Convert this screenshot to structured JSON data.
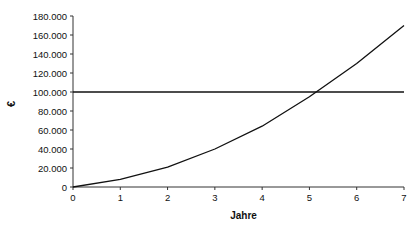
{
  "chart_data": {
    "type": "line",
    "title": "",
    "xlabel": "Jahre",
    "ylabel": "€",
    "x": [
      0,
      1,
      2,
      3,
      4,
      5,
      6,
      7
    ],
    "x_ticks": [
      "0",
      "1",
      "2",
      "3",
      "4",
      "5",
      "6",
      "7"
    ],
    "y_ticks": [
      "0",
      "20.000",
      "40.000",
      "60.000",
      "80.000",
      "100.000",
      "120.000",
      "140.000",
      "160.000",
      "180.000"
    ],
    "xlim": [
      0,
      7
    ],
    "ylim": [
      0,
      180000
    ],
    "grid": false,
    "legend": null,
    "series": [
      {
        "name": "Kurve",
        "values": [
          0,
          8000,
          21000,
          40000,
          64000,
          95000,
          130000,
          170000
        ]
      },
      {
        "name": "Grenze",
        "values": [
          100000,
          100000,
          100000,
          100000,
          100000,
          100000,
          100000,
          100000
        ]
      }
    ],
    "annotations": []
  },
  "colors": {
    "line": "#111111",
    "axis": "#333333",
    "background": "#ffffff"
  }
}
